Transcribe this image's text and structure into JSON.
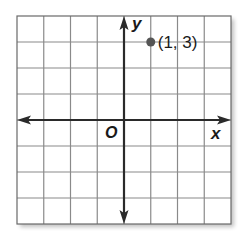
{
  "graph": {
    "grid": {
      "left": 17,
      "top": 16,
      "right": 231,
      "bottom": 224,
      "columns": 8,
      "rows": 8,
      "x_range": [
        -4,
        4
      ],
      "y_range": [
        -4,
        4
      ],
      "line_color": "#8a8a8a",
      "border_color": "#6a6a6a"
    },
    "axes": {
      "color": "#2a2a2a",
      "x_label": "x",
      "y_label": "y",
      "origin_label": "O"
    },
    "point": {
      "x": 1,
      "y": 3,
      "label": "(1, 3)",
      "color": "#555555"
    }
  },
  "chart_data": {
    "type": "scatter",
    "title": "",
    "xlabel": "x",
    "ylabel": "y",
    "xlim": [
      -4,
      4
    ],
    "ylim": [
      -4,
      4
    ],
    "grid": true,
    "series": [
      {
        "name": "point",
        "x": [
          1
        ],
        "y": [
          3
        ],
        "labels": [
          "(1, 3)"
        ]
      }
    ],
    "annotations": [
      "O",
      "(1, 3)"
    ]
  }
}
